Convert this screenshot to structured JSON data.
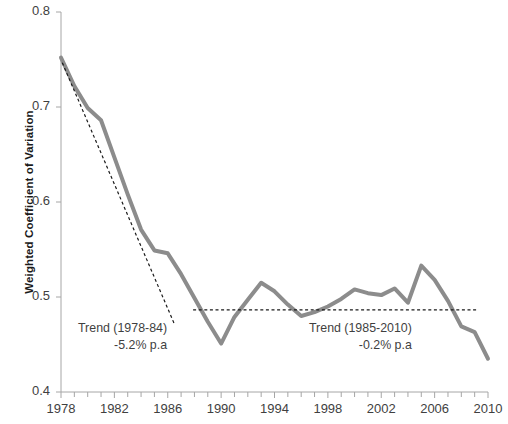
{
  "chart_data": {
    "type": "line",
    "title": "",
    "xlabel": "",
    "ylabel": "Weighted Coefficient of Variation",
    "xlim": [
      1978,
      2010
    ],
    "ylim": [
      0.4,
      0.8
    ],
    "grid": false,
    "legend": "none",
    "y_ticks": [
      "0.4",
      "0.5",
      "0.6",
      "0.7",
      "0.8"
    ],
    "y_tick_values": [
      0.4,
      0.5,
      0.6,
      0.7,
      0.8
    ],
    "x_ticks": [
      "1978",
      "1982",
      "1986",
      "1990",
      "1994",
      "1998",
      "2002",
      "2006",
      "2010"
    ],
    "x_tick_values": [
      1978,
      1982,
      1986,
      1990,
      1994,
      1998,
      2002,
      2006,
      2010
    ],
    "x_minor_tick_interval": 1,
    "series": [
      {
        "name": "Weighted Coefficient of Variation",
        "color": "#8c8c8c",
        "style": "solid",
        "width": 4,
        "x": [
          1978,
          1979,
          1980,
          1981,
          1982,
          1983,
          1984,
          1985,
          1986,
          1987,
          1988,
          1989,
          1990,
          1991,
          1992,
          1993,
          1994,
          1995,
          1996,
          1997,
          1998,
          1999,
          2000,
          2001,
          2002,
          2003,
          2004,
          2005,
          2006,
          2007,
          2008,
          2009,
          2010
        ],
        "y": [
          0.752,
          0.722,
          0.699,
          0.686,
          0.647,
          0.608,
          0.571,
          0.549,
          0.546,
          0.524,
          0.499,
          0.474,
          0.451,
          0.479,
          0.497,
          0.515,
          0.506,
          0.492,
          0.48,
          0.484,
          0.49,
          0.498,
          0.508,
          0.504,
          0.502,
          0.509,
          0.494,
          0.533,
          0.518,
          0.496,
          0.469,
          0.463,
          0.435
        ]
      },
      {
        "name": "Trend (1978-84)",
        "color": "#1a1a1a",
        "style": "dashed",
        "width": 1.2,
        "x": [
          1978.1,
          1986.5
        ],
        "y": [
          0.7465,
          0.4715
        ]
      },
      {
        "name": "Trend (1985-2010)",
        "color": "#1a1a1a",
        "style": "dashed",
        "width": 1.2,
        "x": [
          1987.9,
          2009.2
        ],
        "y": [
          0.4865,
          0.4865
        ]
      }
    ],
    "annotations": [
      {
        "name": "trend-1978-84-label",
        "line1": "Trend (1978-84)",
        "line2": "-5.2% p.a",
        "x_px": 78,
        "y_px": 320
      },
      {
        "name": "trend-1985-2010-label",
        "line1": "Trend (1985-2010)",
        "line2": "-0.2% p.a",
        "x_px": 309,
        "y_px": 320
      }
    ],
    "axis_color": "#a6a6a6",
    "background": "#ffffff"
  }
}
